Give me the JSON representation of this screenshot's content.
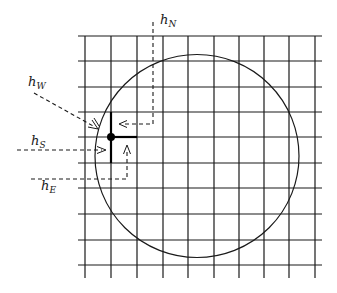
{
  "figure": {
    "type": "grid-with-circular-boundary",
    "grid": {
      "vertical_lines_x": [
        85,
        111,
        137,
        163,
        188,
        214,
        239,
        264,
        289,
        315
      ],
      "horizontal_lines_y": [
        36,
        61,
        87,
        112,
        137,
        163,
        188,
        214,
        240,
        265
      ],
      "x_extent": [
        78,
        322
      ],
      "y_extent": [
        36,
        278
      ]
    },
    "circle": {
      "cx": 197,
      "cy": 156,
      "rx": 102,
      "ry": 101.5
    },
    "node": {
      "x": 111,
      "y": 137,
      "radius": 4
    },
    "labels": {
      "north": {
        "base": "h",
        "sub": "N"
      },
      "west": {
        "base": "h",
        "sub": "W"
      },
      "south": {
        "base": "h",
        "sub": "S"
      },
      "east": {
        "base": "h",
        "sub": "E"
      }
    }
  }
}
